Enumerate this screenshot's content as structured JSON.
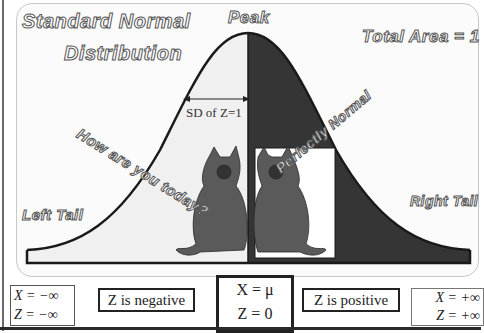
{
  "diagram": {
    "title_line1": "Standard Normal",
    "title_line2": "Distribution",
    "peak_label": "Peak",
    "total_area_label": "Total Area = 1",
    "sd_label": "SD of Z=1",
    "left_tail_label": "Left Tail",
    "right_tail_label": "Right Tail",
    "left_caption": "How are you today?",
    "right_caption": "Perfectly Normal",
    "colors": {
      "left_area": "#f0f0f0",
      "right_area": "#353535",
      "curve": "#1a1a1a",
      "cat_box": "#ffffff"
    },
    "images": {
      "left_cat": "cat-illustration",
      "right_cat": "cat-illustration-mirrored"
    }
  },
  "bottom": {
    "neg_inf": {
      "x": "X = −∞",
      "z": "Z = −∞"
    },
    "negative": "Z is negative",
    "mean": {
      "x": "X = μ",
      "z": "Z = 0"
    },
    "positive": "Z is positive",
    "pos_inf": {
      "x": "X = +∞",
      "z": "Z = +∞"
    }
  }
}
